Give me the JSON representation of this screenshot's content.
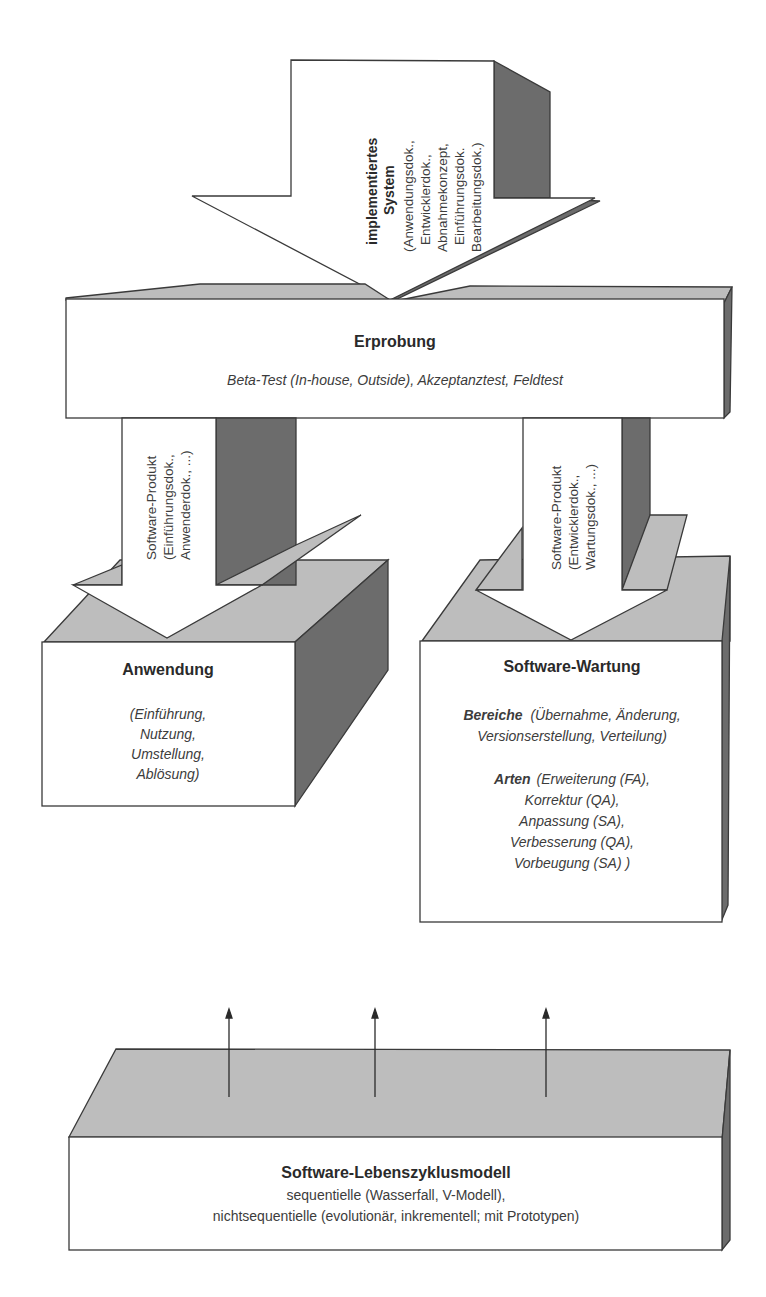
{
  "diagram": {
    "top_arrow": {
      "title_line1": "implementiertes",
      "title_line2": "System",
      "lines": [
        "(Anwendungsdok.,",
        "Entwicklerdok.,",
        "Abnahmekonzept,",
        "Einführungsdok.",
        "Bearbeitungsdok.)"
      ]
    },
    "erprobung": {
      "title": "Erprobung",
      "subtitle": "Beta-Test (In-house, Outside), Akzeptanztest, Feldtest"
    },
    "left_arrow": {
      "lines": [
        "Software-Produkt",
        "(Einführungsdok.,",
        "Anwenderdok., ...)"
      ]
    },
    "right_arrow": {
      "lines": [
        "Software-Produkt",
        "(Entwicklerdok.,",
        "Wartungsdok., ...)"
      ]
    },
    "anwendung": {
      "title": "Anwendung",
      "lines": [
        "(Einführung,",
        "Nutzung,",
        "Umstellung,",
        "Ablösung)"
      ]
    },
    "wartung": {
      "title": "Software-Wartung",
      "bereiche_label": "Bereiche",
      "bereiche_line1": "(Übernahme, Änderung,",
      "bereiche_line2": "Versionserstellung, Verteilung)",
      "arten_label": "Arten",
      "arten_line1": "(Erweiterung (FA),",
      "arten_lines": [
        "Korrektur (QA),",
        "Anpassung (SA),",
        "Verbesserung (QA),",
        "Vorbeugung (SA) )"
      ]
    },
    "lebenszyklus": {
      "title": "Software-Lebenszyklusmodell",
      "line1": "sequentielle (Wasserfall, V-Modell),",
      "line2": "nichtsequentielle (evolutionär, inkrementell; mit Prototypen)"
    },
    "colors": {
      "face": "#ffffff",
      "top": "#bdbdbd",
      "side": "#6c6c6c",
      "outline": "#3a3a3a"
    }
  }
}
